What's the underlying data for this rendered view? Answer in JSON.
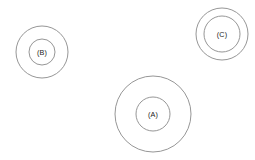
{
  "figure": {
    "background_color": "#ffffff",
    "stroke_color": "#8a8a8a",
    "label_color": "#1a1a1a",
    "width": 255,
    "height": 160
  },
  "chart_data": {
    "type": "scatter",
    "title": "",
    "subtitle": "",
    "xlabel": "",
    "ylabel": "",
    "xlim": [
      0,
      255
    ],
    "ylim": [
      0,
      160
    ],
    "grid": false,
    "legend": "none",
    "marker_style": "concentric-rings",
    "annotations": [
      "(A)",
      "(B)",
      "(C)"
    ],
    "series": [
      {
        "name": "groups",
        "points": [
          {
            "label": "(A)",
            "cx": 153,
            "cy": 114,
            "outer_radius": 38,
            "inner_radius": 17
          },
          {
            "label": "(B)",
            "cx": 42,
            "cy": 52,
            "outer_radius": 26,
            "inner_radius": 13
          },
          {
            "label": "(C)",
            "cx": 222,
            "cy": 34,
            "outer_radius": 26,
            "inner_radius": 18
          }
        ]
      }
    ]
  },
  "groups": [
    {
      "label": "(A)",
      "cx": 153,
      "cy": 114,
      "outer_radius": 38,
      "inner_radius": 17
    },
    {
      "label": "(B)",
      "cx": 42,
      "cy": 52,
      "outer_radius": 26,
      "inner_radius": 13
    },
    {
      "label": "(C)",
      "cx": 222,
      "cy": 34,
      "outer_radius": 26,
      "inner_radius": 18
    }
  ]
}
